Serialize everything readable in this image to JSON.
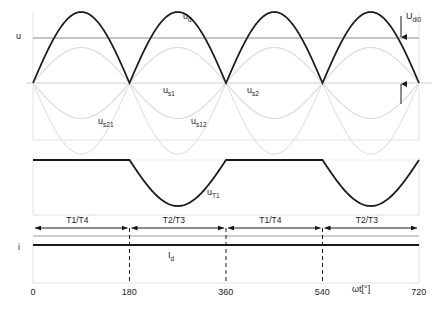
{
  "figure": {
    "type": "waveform-diagram",
    "title_visible": false
  },
  "axes": {
    "voltage_axis_label": "u",
    "current_axis_label": "i",
    "x_axis_label": "ωt[°]",
    "x_ticks": [
      "0",
      "180",
      "360",
      "540",
      "720"
    ],
    "x_tick_values": [
      0,
      180,
      360,
      540,
      720
    ],
    "x_range": [
      0,
      720
    ]
  },
  "annotations": {
    "ud_label": "u",
    "ud_sub": "d",
    "udi0_label": "U",
    "udi0_sub": "di0",
    "us1_label": "u",
    "us1_sub": "s1",
    "us2_label": "u",
    "us2_sub": "s2",
    "us21_label": "u",
    "us21_sub": "s21",
    "us12_label": "u",
    "us12_sub": "s12",
    "ut1_label": "u",
    "ut1_sub": "T1",
    "id_label": "I",
    "id_sub": "d"
  },
  "intervals": [
    {
      "label": "T1/T4",
      "start": 0,
      "end": 180
    },
    {
      "label": "T2/T3",
      "start": 180,
      "end": 360
    },
    {
      "label": "T1/T4",
      "start": 360,
      "end": 540
    },
    {
      "label": "T2/T3",
      "start": 540,
      "end": 720
    }
  ],
  "colors": {
    "curve_bold": "#1a1a1a",
    "curve_light": "#d8d8d8",
    "curve_mid": "#c9c9c9",
    "baseline": "#9a9a9a",
    "frame": "#e2e2e2",
    "dashed": "#1a1a1a",
    "text": "#1a1a1a"
  },
  "chart_data": {
    "type": "line",
    "title": "",
    "xlabel": "ωt[°]",
    "ylabel": "u",
    "xlim": [
      0,
      720
    ],
    "grid": false,
    "legend": "inline-annotations",
    "series": [
      {
        "name": "u_d",
        "display": "u_d",
        "style": "bold-black",
        "description": "Rectified full-wave output voltage, |sin|, period 180 degrees",
        "amplitude": 1.0,
        "mean_value_label": "U_di0",
        "mean_value_fraction_of_peak": 0.637
      },
      {
        "name": "u_s1",
        "display": "u_s1",
        "style": "light-gray",
        "description": "Secondary voltage phase 1, positive half-amplitude sine",
        "amplitude": 0.5,
        "phase_deg": 0
      },
      {
        "name": "u_s2",
        "display": "u_s2",
        "style": "light-gray",
        "description": "Secondary voltage phase 2, half-amplitude sine inverted",
        "amplitude": 0.5,
        "phase_deg": 180
      },
      {
        "name": "u_s21",
        "display": "u_s21",
        "style": "light-gray",
        "description": "Full amplitude sine, negative first half",
        "amplitude": 1.0,
        "phase_deg": 180
      },
      {
        "name": "u_s12",
        "display": "u_s12",
        "style": "light-gray",
        "description": "Full amplitude sine, positive first half",
        "amplitude": 1.0,
        "phase_deg": 0
      },
      {
        "name": "u_T1",
        "display": "u_T1",
        "style": "bold-black",
        "description": "Thyristor T1 voltage: zero during 0-180 and 360-540, negative sine hump during 180-360 and 540-720",
        "amplitude": 1.0
      },
      {
        "name": "I_d",
        "display": "I_d",
        "style": "bold-black",
        "description": "Constant smoothed direct current, flat horizontal line",
        "value": 1.0
      }
    ]
  }
}
